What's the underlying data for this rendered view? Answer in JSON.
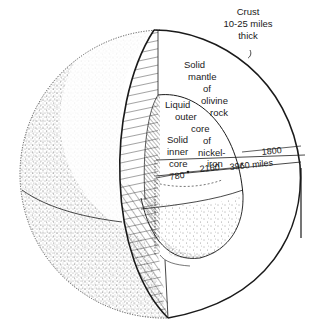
{
  "diagram": {
    "labels": {
      "crust": [
        "Crust",
        "10-25 miles",
        "thick"
      ],
      "mantle": [
        "Solid",
        "mantle",
        "of",
        "olivine",
        "rock"
      ],
      "outer_core": [
        "Liquid",
        "outer",
        "core",
        "of",
        "nickel-",
        "iron"
      ],
      "inner_core": [
        "Solid",
        "inner",
        "core"
      ]
    },
    "dimensions": {
      "inner_core_radius": "780",
      "outer_core_thickness": "2160",
      "mantle_thickness": "1800",
      "earth_radius": "3960 miles"
    },
    "colors": {
      "ink": "#1a1a1a",
      "background": "#ffffff"
    }
  }
}
